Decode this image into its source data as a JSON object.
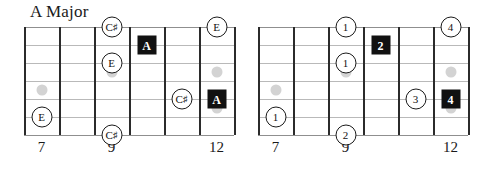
{
  "title": "A Major",
  "geometry": {
    "string_count": 6,
    "fret_line_count": 7,
    "fret_spaces": 6
  },
  "diagrams": [
    {
      "id": "left",
      "label_mode": "note-names",
      "fret_numbers": [
        {
          "label": "7",
          "slot": 1
        },
        {
          "label": "9",
          "slot": 3
        },
        {
          "label": "12",
          "slot": 6
        }
      ],
      "inlays": [
        {
          "slot": 1,
          "string": 4
        },
        {
          "slot": 3,
          "string": 3
        },
        {
          "slot": 6,
          "string": 3
        },
        {
          "slot": 6,
          "string": 5
        }
      ],
      "markers": [
        {
          "text": "C",
          "sharp": true,
          "shape": "circle",
          "string": 1,
          "slot": 3
        },
        {
          "text": "E",
          "sharp": false,
          "shape": "circle",
          "string": 1,
          "slot": 6
        },
        {
          "text": "A",
          "sharp": false,
          "shape": "square",
          "string": 2,
          "slot": 4
        },
        {
          "text": "E",
          "sharp": false,
          "shape": "circle",
          "string": 3,
          "slot": 3
        },
        {
          "text": "A",
          "sharp": false,
          "shape": "square",
          "string": 5,
          "slot": 6
        },
        {
          "text": "C",
          "sharp": true,
          "shape": "circle",
          "string": 5,
          "slot": 5
        },
        {
          "text": "E",
          "sharp": false,
          "shape": "circle",
          "string": 6,
          "slot": 1
        },
        {
          "text": "C",
          "sharp": true,
          "shape": "circle",
          "string": 7,
          "slot": 3
        }
      ]
    },
    {
      "id": "right",
      "label_mode": "scale-degrees",
      "fret_numbers": [
        {
          "label": "7",
          "slot": 1
        },
        {
          "label": "9",
          "slot": 3
        },
        {
          "label": "12",
          "slot": 6
        }
      ],
      "inlays": [
        {
          "slot": 1,
          "string": 4
        },
        {
          "slot": 3,
          "string": 3
        },
        {
          "slot": 6,
          "string": 3
        },
        {
          "slot": 6,
          "string": 5
        }
      ],
      "markers": [
        {
          "text": "1",
          "sharp": false,
          "shape": "circle",
          "string": 1,
          "slot": 3
        },
        {
          "text": "4",
          "sharp": false,
          "shape": "circle",
          "string": 1,
          "slot": 6
        },
        {
          "text": "2",
          "sharp": false,
          "shape": "square",
          "string": 2,
          "slot": 4
        },
        {
          "text": "1",
          "sharp": false,
          "shape": "circle",
          "string": 3,
          "slot": 3
        },
        {
          "text": "4",
          "sharp": false,
          "shape": "square",
          "string": 5,
          "slot": 6
        },
        {
          "text": "3",
          "sharp": false,
          "shape": "circle",
          "string": 5,
          "slot": 5
        },
        {
          "text": "1",
          "sharp": false,
          "shape": "circle",
          "string": 6,
          "slot": 1
        },
        {
          "text": "2",
          "sharp": false,
          "shape": "circle",
          "string": 7,
          "slot": 3
        }
      ]
    }
  ],
  "colors": {
    "fret_line": "#2b2b2b",
    "string_line": "#b9b9b9",
    "inlay": "#d3d3d3",
    "root_marker_bg": "#111111",
    "root_marker_text": "#ffffff",
    "marker_bg": "#ffffff",
    "marker_text": "#111111"
  }
}
